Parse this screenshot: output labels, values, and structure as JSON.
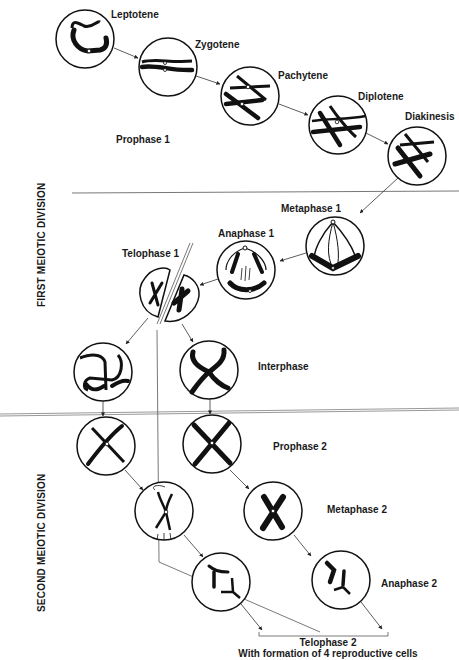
{
  "sections": {
    "first_division": "FIRST MEIOTIC DIVISION",
    "second_division": "SECOND MEIOTIC DIVISION"
  },
  "prophase1": {
    "group_label": "Prophase 1",
    "substages": [
      "Leptotene",
      "Zygotene",
      "Pachytene",
      "Diplotene",
      "Diakinesis"
    ]
  },
  "first_division_stages": {
    "metaphase1": "Metaphase 1",
    "anaphase1": "Anaphase 1",
    "telophase1": "Telophase 1",
    "interphase": "Interphase"
  },
  "second_division_stages": {
    "prophase2": "Prophase 2",
    "metaphase2": "Metaphase 2",
    "anaphase2": "Anaphase 2"
  },
  "result": {
    "line1": "Telophase 2",
    "line2": "With formation of 4 reproductive cells"
  },
  "colors": {
    "ink": "#111111",
    "line": "#555555",
    "background": "#ffffff"
  }
}
